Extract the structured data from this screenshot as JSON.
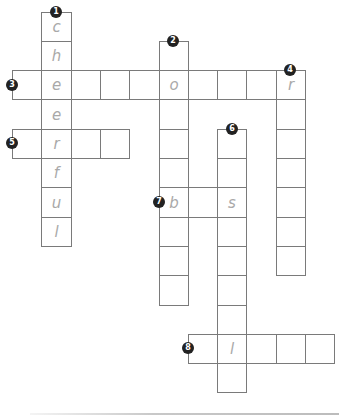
{
  "puzzle": {
    "type": "crossword",
    "cell_size": 29.3,
    "origin_x": 12,
    "origin_y": 11.5,
    "colors": {
      "grid_line": "#7a7a7a",
      "letter": "#a9a9a9",
      "badge_bg": "#222222",
      "badge_text": "#ffffff"
    },
    "entries": [
      {
        "number": "1",
        "direction": "down",
        "col": 1,
        "row": 0,
        "length": 8,
        "letters": [
          "c",
          "h",
          "e",
          "e",
          "r",
          "f",
          "u",
          "l"
        ]
      },
      {
        "number": "2",
        "direction": "down",
        "col": 5,
        "row": 1,
        "length": 9,
        "letters": [
          "",
          "o",
          "",
          "",
          "",
          "b",
          "",
          "",
          ""
        ]
      },
      {
        "number": "3",
        "direction": "across",
        "col": 0,
        "row": 2,
        "length": 10,
        "letters": [
          "",
          "e",
          "",
          "",
          "",
          "o",
          "",
          "",
          "",
          "r"
        ]
      },
      {
        "number": "4",
        "direction": "down",
        "col": 9,
        "row": 2,
        "length": 7,
        "letters": [
          "r",
          "",
          "",
          "",
          "",
          "",
          ""
        ]
      },
      {
        "number": "5",
        "direction": "across",
        "col": 0,
        "row": 4,
        "length": 4,
        "letters": [
          "",
          "r",
          "",
          ""
        ]
      },
      {
        "number": "6",
        "direction": "down",
        "col": 7,
        "row": 4,
        "length": 9,
        "letters": [
          "",
          "",
          "s",
          "",
          "",
          "",
          "",
          "l",
          ""
        ]
      },
      {
        "number": "7",
        "direction": "across",
        "col": 5,
        "row": 6,
        "length": 3,
        "letters": [
          "b",
          "",
          "s"
        ]
      },
      {
        "number": "8",
        "direction": "across",
        "col": 6,
        "row": 11,
        "length": 5,
        "letters": [
          "",
          "l",
          "",
          "",
          ""
        ]
      }
    ]
  }
}
